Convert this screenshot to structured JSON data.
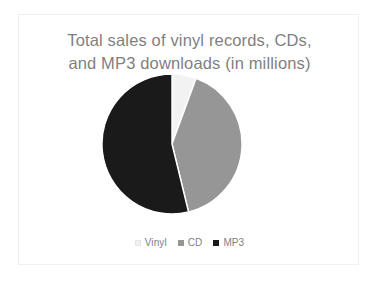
{
  "slide": {
    "background": "#ffffff",
    "border_color": "#f0f0f0"
  },
  "chart_data": {
    "type": "pie",
    "title": "Total sales of vinyl records, CDs,\nand MP3 downloads (in millions)",
    "title_color": "#7f7f7f",
    "xlabel": "",
    "ylabel": "",
    "legend_position": "bottom",
    "grid": false,
    "categories": [
      "Vinyl",
      "CD",
      "MP3"
    ],
    "values": [
      5.6,
      40.6,
      53.8
    ],
    "percentages": [
      5.6,
      40.6,
      53.8
    ],
    "colors": [
      "#f2f2f2",
      "#969696",
      "#1a1a1a"
    ],
    "start_angle_deg": 0,
    "direction": "clockwise",
    "slice_angles_deg": [
      20,
      146,
      194
    ],
    "series": [
      {
        "name": "Sales (millions)",
        "values": [
          5.6,
          40.6,
          53.8
        ]
      }
    ]
  },
  "legend": {
    "items": [
      {
        "label": "Vinyl",
        "color": "#f2f2f2"
      },
      {
        "label": "CD",
        "color": "#969696"
      },
      {
        "label": "MP3",
        "color": "#1a1a1a"
      }
    ]
  }
}
